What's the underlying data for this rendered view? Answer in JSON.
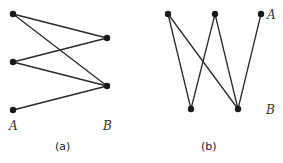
{
  "figures": [
    {
      "id": "a",
      "caption": "(a)",
      "set_labels": {
        "A": "A",
        "B": "B"
      },
      "nodes": [
        {
          "id": "a1",
          "set": "A",
          "x": 13,
          "y": 14
        },
        {
          "id": "a2",
          "set": "A",
          "x": 13,
          "y": 62
        },
        {
          "id": "a3",
          "set": "A",
          "x": 13,
          "y": 110
        },
        {
          "id": "b1",
          "set": "B",
          "x": 107,
          "y": 38
        },
        {
          "id": "b2",
          "set": "B",
          "x": 107,
          "y": 86
        }
      ],
      "edges": [
        [
          "a1",
          "b1"
        ],
        [
          "a1",
          "b2"
        ],
        [
          "a2",
          "b1"
        ],
        [
          "a2",
          "b2"
        ],
        [
          "a3",
          "b2"
        ]
      ]
    },
    {
      "id": "b",
      "caption": "(b)",
      "set_labels": {
        "A": "A",
        "B": "B"
      },
      "nodes": [
        {
          "id": "t1",
          "set": "A",
          "x": 168,
          "y": 14
        },
        {
          "id": "t2",
          "set": "A",
          "x": 215,
          "y": 14
        },
        {
          "id": "t3",
          "set": "A",
          "x": 261,
          "y": 14
        },
        {
          "id": "u1",
          "set": "B",
          "x": 191,
          "y": 109
        },
        {
          "id": "u2",
          "set": "B",
          "x": 238,
          "y": 109
        }
      ],
      "edges": [
        [
          "t1",
          "u1"
        ],
        [
          "t1",
          "u2"
        ],
        [
          "t2",
          "u1"
        ],
        [
          "t2",
          "u2"
        ],
        [
          "t3",
          "u2"
        ]
      ]
    }
  ]
}
